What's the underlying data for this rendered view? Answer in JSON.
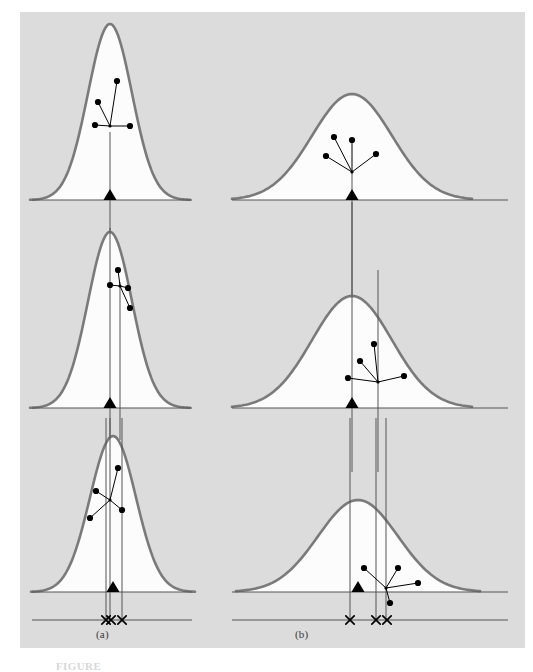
{
  "figure": {
    "background": "#dcdcdc",
    "page_background": "#ffffff",
    "curve_stroke": "#7a7a7a",
    "curve_fill": "#fcfcfc",
    "axis_stroke": "#555555",
    "marker_color": "#000000",
    "caption_a": "(a)",
    "caption_b": "(b)",
    "figure_number": "FIGURE"
  },
  "chart_data": {
    "type": "line",
    "title": "",
    "subtitle": "",
    "xlabel": "",
    "ylabel": "",
    "grid": false,
    "legend": null,
    "columns": [
      {
        "label": "(a)",
        "column_index": 0,
        "sigma_note": "narrow / low variance sampling distribution",
        "baseline_axis_x_range": [
          32,
          192
        ],
        "panels": [
          {
            "panel_index": 0,
            "baseline_y": 200,
            "curve": {
              "center_x": 110,
              "peak_y": 24,
              "half_width": 80,
              "sigma": 22,
              "shape": "narrow"
            },
            "triangle": {
              "x": 110,
              "y": 200,
              "label": "population mean marker"
            },
            "vertical_lines": [
              {
                "x": 110,
                "from_y": 132,
                "to_y": 240
              }
            ],
            "cluster": {
              "hub": {
                "x": 110,
                "y": 126
              },
              "spokes": [
                {
                  "x": 117,
                  "y": 81
                },
                {
                  "x": 98,
                  "y": 102
                },
                {
                  "x": 95,
                  "y": 125
                },
                {
                  "x": 130,
                  "y": 126
                }
              ]
            }
          },
          {
            "panel_index": 1,
            "baseline_y": 408,
            "curve": {
              "center_x": 110,
              "peak_y": 232,
              "half_width": 80,
              "sigma": 22,
              "shape": "narrow"
            },
            "triangle": {
              "x": 110,
              "y": 408,
              "label": "population mean marker"
            },
            "vertical_lines": [
              {
                "x": 110,
                "from_y": 228,
                "to_y": 440
              },
              {
                "x": 120,
                "from_y": 282,
                "to_y": 440
              }
            ],
            "cluster": {
              "hub": {
                "x": 120,
                "y": 286
              },
              "spokes": [
                {
                  "x": 118,
                  "y": 270
                },
                {
                  "x": 110,
                  "y": 285
                },
                {
                  "x": 128,
                  "y": 288
                },
                {
                  "x": 130,
                  "y": 308
                }
              ]
            }
          },
          {
            "panel_index": 2,
            "baseline_y": 592,
            "curve": {
              "center_x": 113,
              "peak_y": 436,
              "half_width": 82,
              "sigma": 23,
              "shape": "narrow"
            },
            "triangle": {
              "x": 113,
              "y": 592,
              "label": "population mean marker"
            },
            "vertical_lines": [
              {
                "x": 106,
                "from_y": 418,
                "to_y": 620
              },
              {
                "x": 110,
                "from_y": 418,
                "to_y": 620
              },
              {
                "x": 122,
                "from_y": 418,
                "to_y": 620
              }
            ],
            "cluster": {
              "hub": {
                "x": 110,
                "y": 500
              },
              "spokes": [
                {
                  "x": 118,
                  "y": 468
                },
                {
                  "x": 96,
                  "y": 491
                },
                {
                  "x": 90,
                  "y": 518
                },
                {
                  "x": 122,
                  "y": 510
                }
              ]
            }
          }
        ],
        "lower_axis": {
          "y": 620,
          "x_range": [
            32,
            192
          ]
        },
        "x_marks": [
          {
            "x": 106
          },
          {
            "x": 111
          },
          {
            "x": 122
          }
        ]
      },
      {
        "label": "(b)",
        "column_index": 1,
        "sigma_note": "wide / high variance sampling distribution",
        "baseline_axis_x_range": [
          232,
          508
        ],
        "panels": [
          {
            "panel_index": 0,
            "baseline_y": 200,
            "curve": {
              "center_x": 352,
              "peak_y": 94,
              "half_width": 120,
              "sigma": 40,
              "shape": "wide"
            },
            "triangle": {
              "x": 352,
              "y": 200,
              "label": "population mean marker"
            },
            "vertical_lines": [
              {
                "x": 352,
                "from_y": 170,
                "to_y": 302
              }
            ],
            "cluster": {
              "hub": {
                "x": 352,
                "y": 172
              },
              "spokes": [
                {
                  "x": 334,
                  "y": 137
                },
                {
                  "x": 352,
                  "y": 140
                },
                {
                  "x": 326,
                  "y": 156
                },
                {
                  "x": 376,
                  "y": 154
                }
              ]
            }
          },
          {
            "panel_index": 1,
            "baseline_y": 408,
            "curve": {
              "center_x": 352,
              "peak_y": 296,
              "half_width": 120,
              "sigma": 40,
              "shape": "wide"
            },
            "triangle": {
              "x": 352,
              "y": 408,
              "label": "population mean marker"
            },
            "vertical_lines": [
              {
                "x": 352,
                "from_y": 202,
                "to_y": 472
              },
              {
                "x": 378,
                "from_y": 270,
                "to_y": 472
              }
            ],
            "cluster": {
              "hub": {
                "x": 378,
                "y": 382
              },
              "spokes": [
                {
                  "x": 374,
                  "y": 344
                },
                {
                  "x": 360,
                  "y": 361
                },
                {
                  "x": 348,
                  "y": 378
                },
                {
                  "x": 404,
                  "y": 376
                }
              ]
            }
          },
          {
            "panel_index": 2,
            "baseline_y": 592,
            "curve": {
              "center_x": 358,
              "peak_y": 500,
              "half_width": 122,
              "sigma": 40,
              "shape": "wide"
            },
            "triangle": {
              "x": 358,
              "y": 592,
              "label": "population mean marker"
            },
            "vertical_lines": [
              {
                "x": 350,
                "from_y": 418,
                "to_y": 620
              },
              {
                "x": 376,
                "from_y": 418,
                "to_y": 620
              },
              {
                "x": 386,
                "from_y": 418,
                "to_y": 620
              }
            ],
            "cluster": {
              "hub": {
                "x": 386,
                "y": 588
              },
              "spokes": [
                {
                  "x": 364,
                  "y": 568
                },
                {
                  "x": 398,
                  "y": 568
                },
                {
                  "x": 418,
                  "y": 583
                },
                {
                  "x": 390,
                  "y": 603
                }
              ]
            }
          }
        ],
        "lower_axis": {
          "y": 620,
          "x_range": [
            232,
            508
          ]
        },
        "x_marks": [
          {
            "x": 350
          },
          {
            "x": 376
          },
          {
            "x": 387
          }
        ]
      }
    ]
  }
}
